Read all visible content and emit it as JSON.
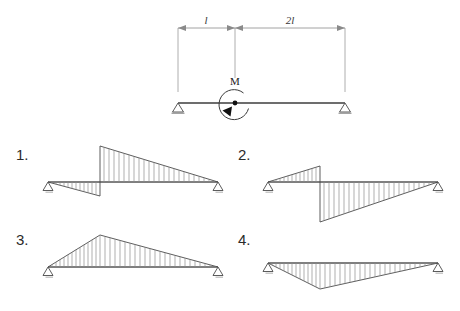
{
  "figure": {
    "background_color": "#ffffff",
    "line_color": "#3c3c3c",
    "hatch_color": "#8c8c8c"
  },
  "beam": {
    "moment_label": "M",
    "left_support_name": "pin-support",
    "right_support_name": "roller-support",
    "span_left_label": "l",
    "span_right_label": "2l",
    "total_span_label": "3l",
    "moment_position_ratio": 0.3333,
    "moment_direction": "counterclockwise",
    "geometry": {
      "x_left": 178,
      "x_moment": 235,
      "x_right": 345,
      "y_beam": 103,
      "y_dimline": 28
    }
  },
  "options": [
    {
      "number": "1.",
      "name": "option-1",
      "description": "Negative triangle from left support to moment point, then positive triangle decaying to right support",
      "baseline_y": 182,
      "x_start": 48,
      "x_jump": 100,
      "x_end": 218,
      "left_peak": 14,
      "right_peak": -36,
      "hatch_count_left": 13,
      "hatch_count_right": 21
    },
    {
      "number": "2.",
      "name": "option-2",
      "description": "Positive triangle from left support to moment point, then negative triangle decaying to right support",
      "baseline_y": 182,
      "x_start": 268,
      "x_jump": 320,
      "x_end": 438,
      "left_peak": -16,
      "right_peak": 40,
      "hatch_count_left": 13,
      "hatch_count_right": 21
    },
    {
      "number": "3.",
      "name": "option-3",
      "description": "Continuous positive triangle peaking above the axis at the moment point",
      "baseline_y": 267,
      "x_start": 48,
      "x_peak": 100,
      "x_end": 218,
      "peak": -32,
      "hatch_count_left": 13,
      "hatch_count_right": 22
    },
    {
      "number": "4.",
      "name": "option-4",
      "description": "Continuous negative triangle peaking below the axis at the moment point",
      "baseline_y": 263,
      "x_start": 268,
      "x_peak": 320,
      "x_end": 438,
      "peak": 26,
      "hatch_count_left": 13,
      "hatch_count_right": 22
    }
  ]
}
